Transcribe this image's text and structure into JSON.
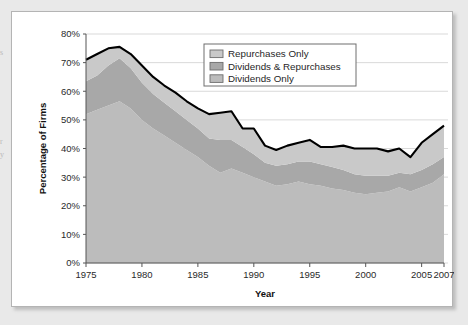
{
  "margin_fragments": [
    {
      "text": "s",
      "top": 48
    },
    {
      "text": "r",
      "top": 137
    },
    {
      "text": "y",
      "top": 150
    }
  ],
  "chart_data": {
    "type": "area",
    "stacked": true,
    "title": "",
    "xlabel": "Year",
    "ylabel": "Percentage of Firms",
    "xlim": [
      1975,
      2007
    ],
    "ylim": [
      0,
      80
    ],
    "grid": true,
    "y_tick_labels": [
      "0%",
      "10%",
      "20%",
      "30%",
      "40%",
      "50%",
      "60%",
      "70%",
      "80%"
    ],
    "y_ticks": [
      0,
      10,
      20,
      30,
      40,
      50,
      60,
      70,
      80
    ],
    "x_tick_labels": [
      "1975",
      "1980",
      "1985",
      "1990",
      "1995",
      "2000",
      "2005",
      "2007"
    ],
    "x_ticks": [
      1975,
      1980,
      1985,
      1990,
      1995,
      2000,
      2005,
      2007
    ],
    "legend_position": "top-right",
    "legend": [
      {
        "label": "Repurchases Only",
        "color": "#c9c9c9"
      },
      {
        "label": "Dividends & Repurchases",
        "color": "#a8a8a8"
      },
      {
        "label": "Dividends Only",
        "color": "#bcbcbc"
      }
    ],
    "total_line_color": "#000000",
    "x": [
      1975,
      1976,
      1977,
      1978,
      1979,
      1980,
      1981,
      1982,
      1983,
      1984,
      1985,
      1986,
      1987,
      1988,
      1989,
      1990,
      1991,
      1992,
      1993,
      1994,
      1995,
      1996,
      1997,
      1998,
      1999,
      2000,
      2001,
      2002,
      2003,
      2004,
      2005,
      2006,
      2007
    ],
    "series": [
      {
        "name": "Dividends Only",
        "color": "#bcbcbc",
        "values": [
          52.0,
          53.5,
          55.0,
          56.5,
          54.0,
          50.0,
          47.0,
          44.5,
          42.0,
          39.5,
          37.0,
          34.0,
          31.5,
          33.0,
          31.5,
          30.0,
          28.5,
          27.0,
          27.5,
          28.5,
          27.5,
          27.0,
          26.0,
          25.5,
          24.5,
          24.0,
          24.5,
          25.0,
          26.5,
          25.0,
          26.5,
          28.0,
          31.0
        ]
      },
      {
        "name": "Dividends & Repurchases",
        "color": "#a8a8a8",
        "values": [
          11.5,
          12.0,
          14.0,
          15.0,
          14.0,
          13.0,
          12.0,
          11.5,
          11.0,
          10.5,
          10.0,
          9.5,
          11.5,
          10.0,
          9.0,
          8.0,
          6.5,
          7.0,
          7.0,
          7.0,
          8.0,
          7.5,
          7.5,
          7.0,
          6.5,
          6.5,
          6.0,
          5.5,
          5.0,
          6.0,
          6.0,
          6.5,
          6.0
        ]
      },
      {
        "name": "Repurchases Only",
        "color": "#c9c9c9",
        "values": [
          7.5,
          7.5,
          6.0,
          4.0,
          5.0,
          6.0,
          6.0,
          6.0,
          6.5,
          6.5,
          7.0,
          8.5,
          9.5,
          10.0,
          6.5,
          9.0,
          6.0,
          5.5,
          6.5,
          6.5,
          7.5,
          6.0,
          7.0,
          8.5,
          9.0,
          9.5,
          9.5,
          8.5,
          8.5,
          6.0,
          9.5,
          10.5,
          11.0
        ]
      }
    ],
    "total": [
      71.0,
      73.0,
      75.0,
      75.5,
      73.0,
      69.0,
      65.0,
      62.0,
      59.5,
      56.5,
      54.0,
      52.0,
      52.5,
      53.0,
      47.0,
      47.0,
      41.0,
      39.5,
      41.0,
      42.0,
      43.0,
      40.5,
      40.5,
      41.0,
      40.0,
      40.0,
      40.0,
      39.0,
      40.0,
      37.0,
      42.0,
      45.0,
      48.0
    ]
  }
}
